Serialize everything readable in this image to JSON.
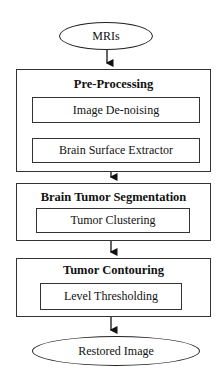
{
  "diagram": {
    "type": "flowchart",
    "input": {
      "label": "MRIs"
    },
    "stages": [
      {
        "title": "Pre-Processing",
        "steps": [
          "Image De-noising",
          "Brain Surface Extractor"
        ]
      },
      {
        "title": "Brain Tumor Segmentation",
        "steps": [
          "Tumor Clustering"
        ]
      },
      {
        "title": "Tumor Contouring",
        "steps": [
          "Level Thresholding"
        ]
      }
    ],
    "output": {
      "label": "Restored Image"
    },
    "colors": {
      "stroke": "#222222",
      "background": "#ffffff",
      "text": "#111111"
    }
  }
}
